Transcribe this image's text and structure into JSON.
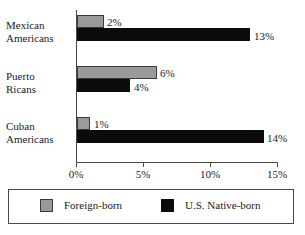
{
  "chart_data": {
    "type": "bar",
    "orientation": "horizontal",
    "title": "",
    "xlabel": "",
    "ylabel": "",
    "xlim": [
      0,
      15
    ],
    "xtick_labels": [
      "0%",
      "5%",
      "10%",
      "15%"
    ],
    "xticks": [
      0,
      5,
      10,
      15
    ],
    "grid": false,
    "legend_position": "bottom",
    "categories": [
      "Mexican Americans",
      "Puerto Ricans",
      "Cuban Americans"
    ],
    "category_lines": [
      [
        "Mexican",
        "Americans"
      ],
      [
        "Puerto",
        "Ricans"
      ],
      [
        "Cuban",
        "Americans"
      ]
    ],
    "series": [
      {
        "name": "Foreign-born",
        "color": "#9a9a9a",
        "values": [
          2,
          6,
          1
        ],
        "value_labels": [
          "2%",
          "6%",
          "1%"
        ]
      },
      {
        "name": "U.S. Native-born",
        "color": "#0b0b0b",
        "values": [
          13,
          4,
          14
        ],
        "value_labels": [
          "13%",
          "4%",
          "14%"
        ]
      }
    ]
  },
  "legend": {
    "entries": [
      {
        "label": "Foreign-born",
        "swatch": "gray-swatch-icon"
      },
      {
        "label": "U.S. Native-born",
        "swatch": "black-swatch-icon"
      }
    ]
  }
}
